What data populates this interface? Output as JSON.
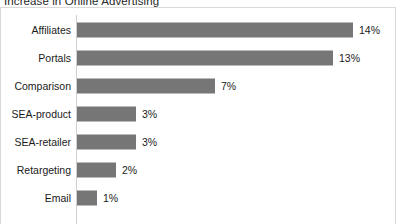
{
  "chart": {
    "title": "Increase in Online Advertising",
    "value_suffix": "%",
    "bar_color": "#767676",
    "axis_color": "#d0d0d0",
    "border_color": "#d9d9d9",
    "background": "#ffffff",
    "text_color": "#1a1a1a"
  },
  "chart_data": {
    "type": "bar",
    "orientation": "horizontal",
    "title": "Increase in Online Advertising",
    "xlabel": "",
    "ylabel": "",
    "xlim": [
      0,
      14
    ],
    "grid": false,
    "legend": false,
    "categories": [
      "Affiliates",
      "Portals",
      "Comparison",
      "SEA-product",
      "SEA-retailer",
      "Retargeting",
      "Email"
    ],
    "values": [
      14,
      13,
      7,
      3,
      3,
      2,
      1
    ],
    "data_labels": [
      "14%",
      "13%",
      "7%",
      "3%",
      "3%",
      "2%",
      "1%"
    ]
  },
  "rows": [
    {
      "label": "Affiliates",
      "value": 14,
      "data_label": "14%",
      "bar_px": 276,
      "top": 1
    },
    {
      "label": "Portals",
      "value": 13,
      "data_label": "13%",
      "bar_px": 256,
      "top": 29
    },
    {
      "label": "Comparison",
      "value": 7,
      "data_label": "7%",
      "bar_px": 138,
      "top": 57
    },
    {
      "label": "SEA-product",
      "value": 3,
      "data_label": "3%",
      "bar_px": 59,
      "top": 85
    },
    {
      "label": "SEA-retailer",
      "value": 3,
      "data_label": "3%",
      "bar_px": 59,
      "top": 113
    },
    {
      "label": "Retargeting",
      "value": 2,
      "data_label": "2%",
      "bar_px": 39,
      "top": 141
    },
    {
      "label": "Email",
      "value": 1,
      "data_label": "1%",
      "bar_px": 20,
      "top": 169
    }
  ]
}
